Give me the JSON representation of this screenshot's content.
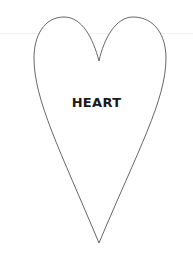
{
  "shape": {
    "name": "heart",
    "stroke_color": "#555555",
    "fill_color": "#ffffff"
  },
  "label": {
    "text": "HEART",
    "color": "#1a1a1a"
  },
  "colors": {
    "background": "#ffffff"
  }
}
